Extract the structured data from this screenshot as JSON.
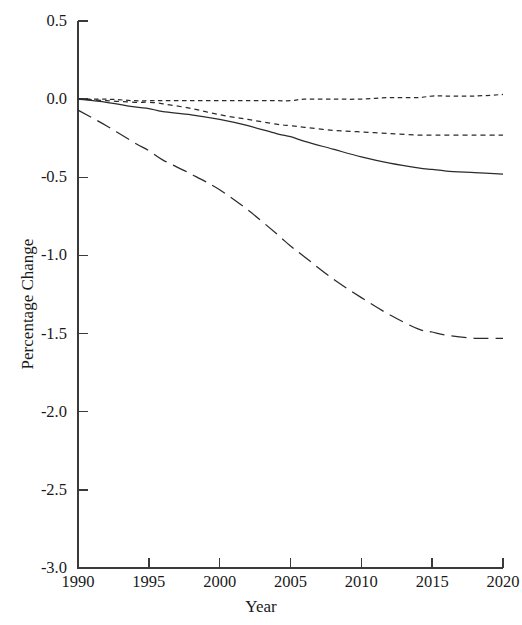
{
  "chart_data": {
    "type": "line",
    "title": "",
    "xlabel": "Year",
    "ylabel": "Percentage Change",
    "xlim": [
      1990,
      2020
    ],
    "ylim": [
      -3.0,
      0.5
    ],
    "grid": false,
    "legend": "none",
    "x_ticks": [
      "1990",
      "1995",
      "2000",
      "2005",
      "2010",
      "2015",
      "2020"
    ],
    "x_tick_values": [
      1990,
      1995,
      2000,
      2005,
      2010,
      2015,
      2020
    ],
    "y_ticks": [
      "0.5",
      "0.0",
      "-0.5",
      "-1.0",
      "-1.5",
      "-2.0",
      "-2.5",
      "-3.0"
    ],
    "y_tick_values": [
      0.5,
      0.0,
      -0.5,
      -1.0,
      -1.5,
      -2.0,
      -2.5,
      -3.0
    ],
    "x": [
      1990,
      1992,
      1994,
      1995,
      1996,
      1998,
      2000,
      2002,
      2004,
      2005,
      2006,
      2008,
      2010,
      2012,
      2014,
      2015,
      2016,
      2018,
      2020
    ],
    "series": [
      {
        "name": "series-1",
        "style": "dotted",
        "color": "#2b2b2b",
        "values": [
          0.0,
          0.0,
          -0.01,
          -0.01,
          -0.01,
          -0.01,
          -0.01,
          -0.01,
          -0.01,
          -0.01,
          0.0,
          0.0,
          0.0,
          0.01,
          0.01,
          0.02,
          0.02,
          0.02,
          0.03
        ]
      },
      {
        "name": "series-2",
        "style": "dashed",
        "color": "#2b2b2b",
        "values": [
          0.0,
          -0.01,
          -0.02,
          -0.02,
          -0.03,
          -0.06,
          -0.1,
          -0.13,
          -0.16,
          -0.17,
          -0.18,
          -0.2,
          -0.21,
          -0.22,
          -0.23,
          -0.23,
          -0.23,
          -0.23,
          -0.23
        ]
      },
      {
        "name": "series-3",
        "style": "solid",
        "color": "#2b2b2b",
        "values": [
          0.0,
          -0.02,
          -0.05,
          -0.06,
          -0.08,
          -0.1,
          -0.13,
          -0.17,
          -0.22,
          -0.24,
          -0.27,
          -0.32,
          -0.37,
          -0.41,
          -0.44,
          -0.45,
          -0.46,
          -0.47,
          -0.48
        ]
      },
      {
        "name": "series-4",
        "style": "longdash",
        "color": "#2b2b2b",
        "values": [
          -0.07,
          -0.17,
          -0.28,
          -0.33,
          -0.39,
          -0.48,
          -0.58,
          -0.71,
          -0.86,
          -0.94,
          -1.01,
          -1.15,
          -1.27,
          -1.38,
          -1.47,
          -1.49,
          -1.51,
          -1.53,
          -1.53
        ]
      }
    ]
  },
  "axes": {
    "x_title": "Year",
    "y_title": "Percentage Change"
  }
}
